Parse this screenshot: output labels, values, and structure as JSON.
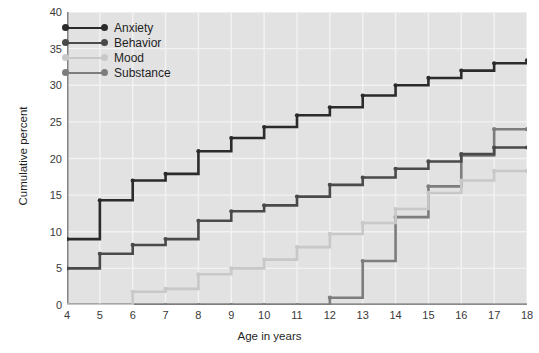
{
  "chart_data": {
    "type": "line",
    "subtype": "step",
    "title": "",
    "xlabel": "Age in years",
    "ylabel": "Cumulative percent",
    "xlim": [
      4,
      18
    ],
    "ylim": [
      0,
      40
    ],
    "xticks": [
      4,
      5,
      6,
      7,
      8,
      9,
      10,
      11,
      12,
      13,
      14,
      15,
      16,
      17,
      18
    ],
    "yticks": [
      0,
      5,
      10,
      15,
      20,
      25,
      30,
      35,
      40
    ],
    "grid": true,
    "grid_color": "#f2f2f2",
    "panel_background": "#e2e2e2",
    "legend_position": "top-left",
    "x": [
      4,
      5,
      6,
      7,
      8,
      9,
      10,
      11,
      12,
      13,
      14,
      15,
      16,
      17,
      18
    ],
    "series": [
      {
        "name": "Anxiety",
        "color": "#2b2b2b",
        "values": [
          9.0,
          14.3,
          17.0,
          17.9,
          21.0,
          22.8,
          24.3,
          25.9,
          27.0,
          28.6,
          30.0,
          31.0,
          32.0,
          33.0,
          33.4
        ]
      },
      {
        "name": "Behavior",
        "color": "#4a4a4a",
        "values": [
          5.0,
          7.0,
          8.2,
          9.0,
          11.5,
          12.8,
          13.6,
          14.8,
          16.4,
          17.4,
          18.6,
          19.6,
          20.6,
          21.5,
          21.5
        ]
      },
      {
        "name": "Mood",
        "color": "#c8c8c8",
        "values": [
          0.0,
          0.0,
          1.8,
          2.2,
          4.2,
          5.0,
          6.2,
          7.9,
          9.7,
          11.2,
          13.1,
          15.3,
          17.0,
          18.3,
          18.3
        ]
      },
      {
        "name": "Substance",
        "color": "#7d7d7d",
        "values": [
          0.0,
          0.0,
          0.0,
          0.0,
          0.0,
          0.0,
          0.0,
          0.0,
          1.0,
          6.0,
          12.0,
          16.2,
          20.4,
          24.0,
          24.0
        ]
      }
    ]
  },
  "axes": {
    "x_title": "Age in years",
    "y_title": "Cumulative percent"
  }
}
